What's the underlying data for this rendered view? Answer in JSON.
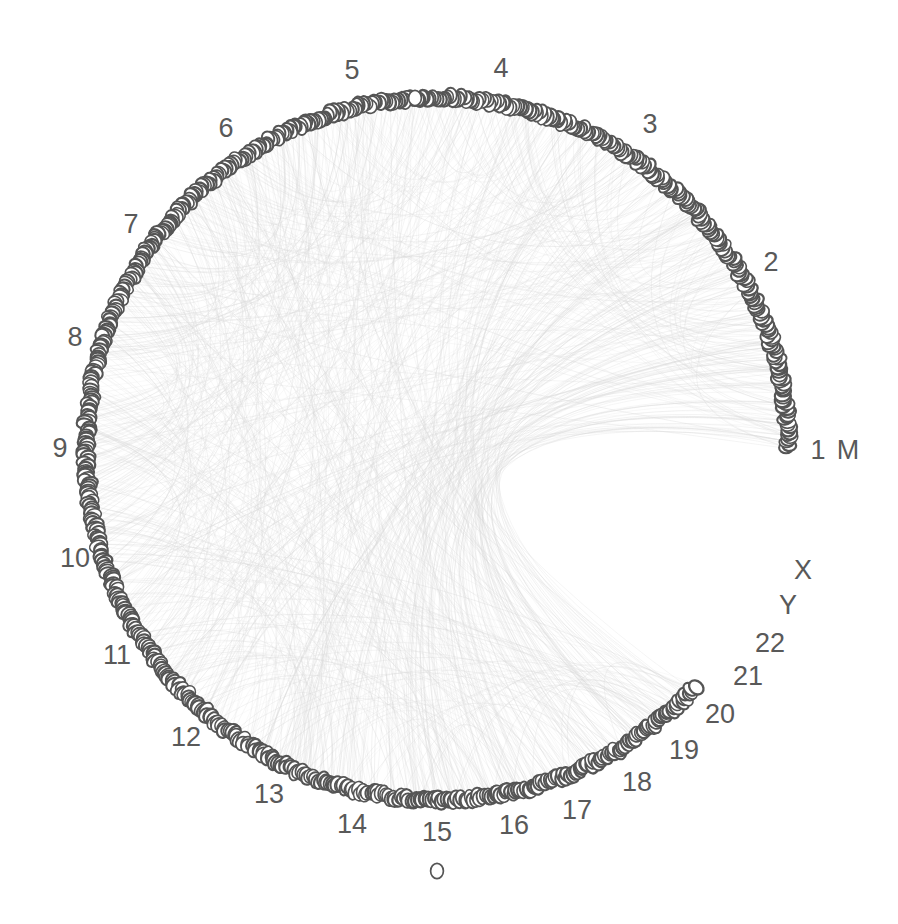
{
  "figure": {
    "kind": "circular-genome-plot",
    "title": "",
    "background_color": "#ffffff",
    "node_stroke_color": "#555555",
    "node_fill_color": "#ffffff",
    "edge_color": "#d8d8d8",
    "label_color": "#595959",
    "circle": {
      "center_x": 437,
      "center_y": 449,
      "radius": 351
    }
  },
  "chart_data": {
    "type": "scatter",
    "title": "",
    "xlabel": "",
    "ylabel": "",
    "grid": false,
    "legend": "none",
    "categories": [
      "1",
      "2",
      "3",
      "4",
      "5",
      "6",
      "7",
      "8",
      "9",
      "10",
      "11",
      "12",
      "13",
      "14",
      "15",
      "16",
      "17",
      "18",
      "19",
      "20",
      "21",
      "22",
      "X",
      "Y",
      "M"
    ],
    "values": [
      248,
      242,
      198,
      190,
      181,
      170,
      159,
      145,
      138,
      133,
      135,
      133,
      114,
      107,
      102,
      90,
      83,
      80,
      58,
      64,
      46,
      50,
      156,
      57,
      1
    ],
    "series": [
      {
        "name": "loci per chromosome (arc span, Mb)",
        "values": [
          248,
          242,
          198,
          190,
          181,
          170,
          159,
          145,
          138,
          133,
          135,
          133,
          114,
          107,
          102,
          90,
          83,
          80,
          58,
          64,
          46,
          50,
          156,
          57,
          1
        ]
      }
    ],
    "arcs": [
      {
        "label": "1",
        "start_deg": 0.0,
        "end_deg": 25.6,
        "nodes": 62,
        "label_x": 818,
        "label_y": 452
      },
      {
        "label": "2",
        "start_deg": 25.6,
        "end_deg": 50.5,
        "nodes": 58,
        "label_x": 771,
        "label_y": 264
      },
      {
        "label": "3",
        "start_deg": 50.5,
        "end_deg": 70.9,
        "nodes": 50,
        "label_x": 650,
        "label_y": 126
      },
      {
        "label": "4",
        "start_deg": 70.9,
        "end_deg": 90.5,
        "nodes": 46,
        "label_x": 501,
        "label_y": 70
      },
      {
        "label": "5",
        "start_deg": 90.5,
        "end_deg": 109.1,
        "nodes": 45,
        "label_x": 352,
        "label_y": 72
      },
      {
        "label": "6",
        "start_deg": 109.1,
        "end_deg": 126.6,
        "nodes": 42,
        "label_x": 226,
        "label_y": 130
      },
      {
        "label": "7",
        "start_deg": 126.6,
        "end_deg": 142.9,
        "nodes": 40,
        "label_x": 131,
        "label_y": 226
      },
      {
        "label": "8",
        "start_deg": 142.9,
        "end_deg": 157.8,
        "nodes": 36,
        "label_x": 75,
        "label_y": 339
      },
      {
        "label": "9",
        "start_deg": 157.8,
        "end_deg": 172.0,
        "nodes": 34,
        "label_x": 60,
        "label_y": 450
      },
      {
        "label": "10",
        "start_deg": 172.0,
        "end_deg": 185.7,
        "nodes": 33,
        "label_x": 75,
        "label_y": 560
      },
      {
        "label": "11",
        "start_deg": 185.7,
        "end_deg": 199.6,
        "nodes": 34,
        "label_x": 117,
        "label_y": 657
      },
      {
        "label": "12",
        "start_deg": 199.6,
        "end_deg": 213.3,
        "nodes": 33,
        "label_x": 186,
        "label_y": 739
      },
      {
        "label": "13",
        "start_deg": 213.3,
        "end_deg": 225.0,
        "nodes": 28,
        "label_x": 269,
        "label_y": 796
      },
      {
        "label": "14",
        "start_deg": 225.0,
        "end_deg": 236.0,
        "nodes": 26,
        "label_x": 352,
        "label_y": 826
      },
      {
        "label": "15",
        "start_deg": 236.0,
        "end_deg": 246.5,
        "nodes": 25,
        "label_x": 437,
        "label_y": 834
      },
      {
        "label": "16",
        "start_deg": 246.5,
        "end_deg": 255.8,
        "nodes": 22,
        "label_x": 514,
        "label_y": 827
      },
      {
        "label": "17",
        "start_deg": 255.8,
        "end_deg": 264.3,
        "nodes": 20,
        "label_x": 577,
        "label_y": 812
      },
      {
        "label": "18",
        "start_deg": 264.3,
        "end_deg": 272.5,
        "nodes": 20,
        "label_x": 637,
        "label_y": 784
      },
      {
        "label": "19",
        "start_deg": 272.5,
        "end_deg": 278.5,
        "nodes": 14,
        "label_x": 684,
        "label_y": 752
      },
      {
        "label": "20",
        "start_deg": 278.5,
        "end_deg": 285.1,
        "nodes": 16,
        "label_x": 720,
        "label_y": 716
      },
      {
        "label": "21",
        "start_deg": 285.1,
        "end_deg": 289.8,
        "nodes": 11,
        "label_x": 748,
        "label_y": 678
      },
      {
        "label": "22",
        "start_deg": 289.8,
        "end_deg": 294.9,
        "nodes": 12,
        "label_x": 770,
        "label_y": 645
      },
      {
        "label": "X",
        "start_deg": 294.9,
        "end_deg": 310.9,
        "nodes": 38,
        "label_x": 803,
        "label_y": 572
      },
      {
        "label": "Y",
        "start_deg": 310.9,
        "end_deg": 316.8,
        "nodes": 14,
        "label_x": 788,
        "label_y": 607
      },
      {
        "label": "M",
        "start_deg": 316.8,
        "end_deg": 360.0,
        "nodes": 1,
        "label_x": 848,
        "label_y": 452
      }
    ],
    "outliers": [
      {
        "name": "top-gap-node",
        "x": 415,
        "y": 98
      },
      {
        "name": "bottom-lone-node",
        "x": 437,
        "y": 871
      }
    ],
    "total_nodes": 760,
    "edge_count": 900
  },
  "labels": {
    "chr1": "1",
    "chr2": "2",
    "chr3": "3",
    "chr4": "4",
    "chr5": "5",
    "chr6": "6",
    "chr7": "7",
    "chr8": "8",
    "chr9": "9",
    "chr10": "10",
    "chr11": "11",
    "chr12": "12",
    "chr13": "13",
    "chr14": "14",
    "chr15": "15",
    "chr16": "16",
    "chr17": "17",
    "chr18": "18",
    "chr19": "19",
    "chr20": "20",
    "chr21": "21",
    "chr22": "22",
    "chrX": "X",
    "chrY": "Y",
    "chrM": "M"
  }
}
